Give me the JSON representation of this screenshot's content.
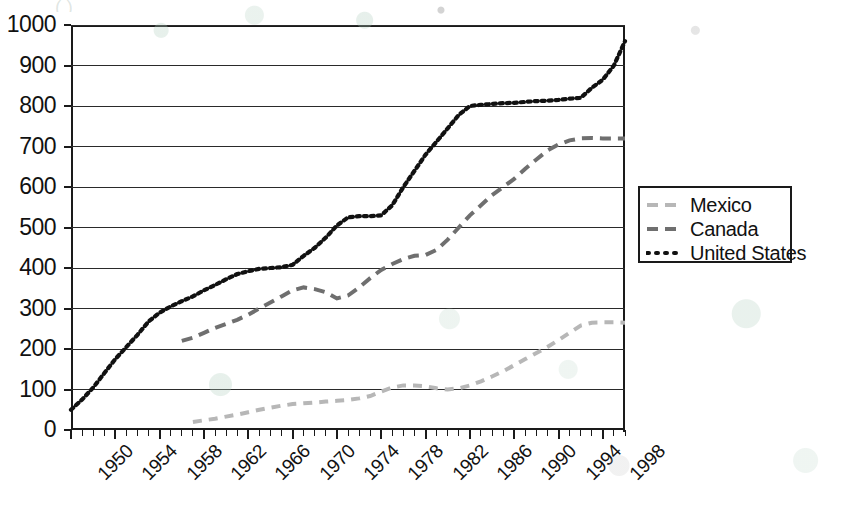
{
  "figure": {
    "title_fragment": "(                           )",
    "background": "#ffffff"
  },
  "axes": {
    "y_ticks": [
      "0",
      "100",
      "200",
      "300",
      "400",
      "500",
      "600",
      "700",
      "800",
      "900",
      "1000"
    ],
    "x_ticks": [
      "1950",
      "1954",
      "1958",
      "1962",
      "1966",
      "1970",
      "1974",
      "1978",
      "1982",
      "1986",
      "1990",
      "1994",
      "1998"
    ],
    "xlabel": "",
    "ylabel": ""
  },
  "legend": {
    "position": "right",
    "entries": [
      {
        "label": "Mexico",
        "color": "#b7b7b7",
        "style": "dashed"
      },
      {
        "label": "Canada",
        "color": "#6f6f6f",
        "style": "dashed"
      },
      {
        "label": "United States",
        "color": "#111111",
        "style": "dotted"
      }
    ]
  },
  "chart_data": {
    "type": "line",
    "title": "",
    "xlabel": "",
    "ylabel": "",
    "xlim": [
      1950,
      2000
    ],
    "ylim": [
      0,
      1000
    ],
    "ytick_step": 100,
    "xtick_step": 4,
    "grid": "horizontal",
    "legend_position": "right",
    "x": [
      1950,
      1951,
      1952,
      1953,
      1954,
      1955,
      1956,
      1957,
      1958,
      1959,
      1960,
      1961,
      1962,
      1963,
      1964,
      1965,
      1966,
      1967,
      1968,
      1969,
      1970,
      1971,
      1972,
      1973,
      1974,
      1975,
      1976,
      1977,
      1978,
      1979,
      1980,
      1981,
      1982,
      1983,
      1984,
      1985,
      1986,
      1987,
      1988,
      1989,
      1990,
      1991,
      1992,
      1993,
      1994,
      1995,
      1996,
      1997,
      1998,
      1999,
      2000
    ],
    "series": [
      {
        "name": "Mexico",
        "color": "#b7b7b7",
        "style": "dashed",
        "values": [
          null,
          null,
          null,
          null,
          null,
          null,
          null,
          null,
          null,
          null,
          null,
          20,
          24,
          28,
          33,
          38,
          44,
          50,
          55,
          60,
          64,
          66,
          68,
          70,
          72,
          74,
          78,
          84,
          95,
          105,
          110,
          110,
          108,
          103,
          100,
          103,
          110,
          120,
          132,
          145,
          160,
          175,
          190,
          205,
          222,
          240,
          258,
          265,
          266,
          266,
          265
        ]
      },
      {
        "name": "Canada",
        "color": "#6f6f6f",
        "style": "dashed",
        "values": [
          null,
          null,
          null,
          null,
          null,
          null,
          null,
          null,
          null,
          null,
          220,
          228,
          240,
          252,
          262,
          272,
          285,
          300,
          315,
          330,
          345,
          352,
          348,
          340,
          325,
          332,
          352,
          375,
          395,
          410,
          422,
          430,
          432,
          445,
          470,
          500,
          530,
          555,
          580,
          600,
          620,
          645,
          668,
          690,
          705,
          715,
          720,
          721,
          720,
          720,
          720
        ]
      },
      {
        "name": "United States",
        "color": "#111111",
        "style": "dotted",
        "values": [
          50,
          75,
          105,
          140,
          175,
          205,
          235,
          268,
          290,
          305,
          318,
          330,
          345,
          358,
          372,
          385,
          392,
          398,
          400,
          402,
          408,
          430,
          450,
          475,
          505,
          525,
          528,
          528,
          530,
          555,
          600,
          640,
          680,
          712,
          745,
          778,
          800,
          803,
          805,
          807,
          808,
          810,
          812,
          813,
          815,
          818,
          820,
          845,
          865,
          900,
          960
        ]
      }
    ]
  }
}
